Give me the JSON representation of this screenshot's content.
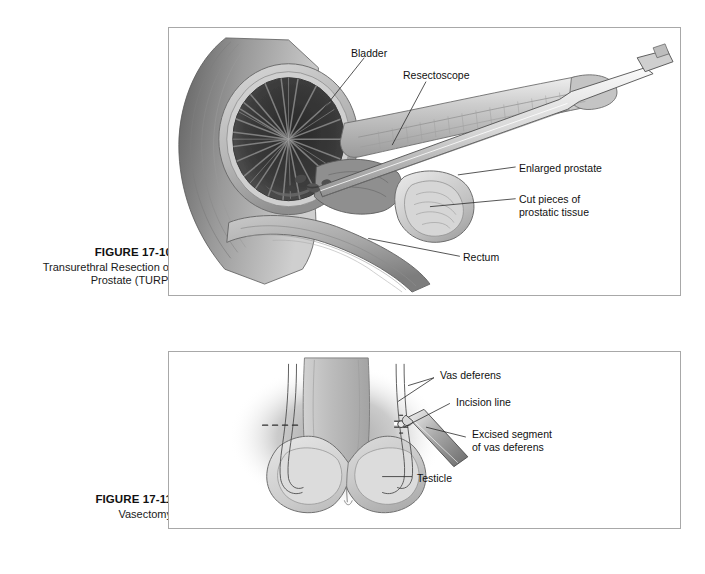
{
  "page": {
    "background_color": "#ffffff",
    "frame_border_color": "#a8a8a8"
  },
  "figures": [
    {
      "id": "figure-17-10",
      "number": "FIGURE 17-10",
      "title": "Transurethral Resection\nof Prostate (TURP)",
      "illustration": "sagittal-section-male-pelvis-with-resectoscope",
      "labels": [
        {
          "key": "bladder",
          "text": "Bladder"
        },
        {
          "key": "resectoscope",
          "text": "Resectoscope"
        },
        {
          "key": "enlarged-prostate",
          "text": "Enlarged prostate"
        },
        {
          "key": "cut-pieces",
          "text": "Cut pieces of\nprostatic tissue"
        },
        {
          "key": "rectum",
          "text": "Rectum"
        }
      ]
    },
    {
      "id": "figure-17-11",
      "number": "FIGURE 17-11",
      "title": "Vasectomy",
      "illustration": "scrotum-with-vas-deferens-and-testicles",
      "labels": [
        {
          "key": "vas-deferens",
          "text": "Vas deferens"
        },
        {
          "key": "incision-line",
          "text": "Incision line"
        },
        {
          "key": "excised-segment",
          "text": "Excised segment\nof vas deferens"
        },
        {
          "key": "testicle",
          "text": "Testicle"
        }
      ]
    }
  ]
}
